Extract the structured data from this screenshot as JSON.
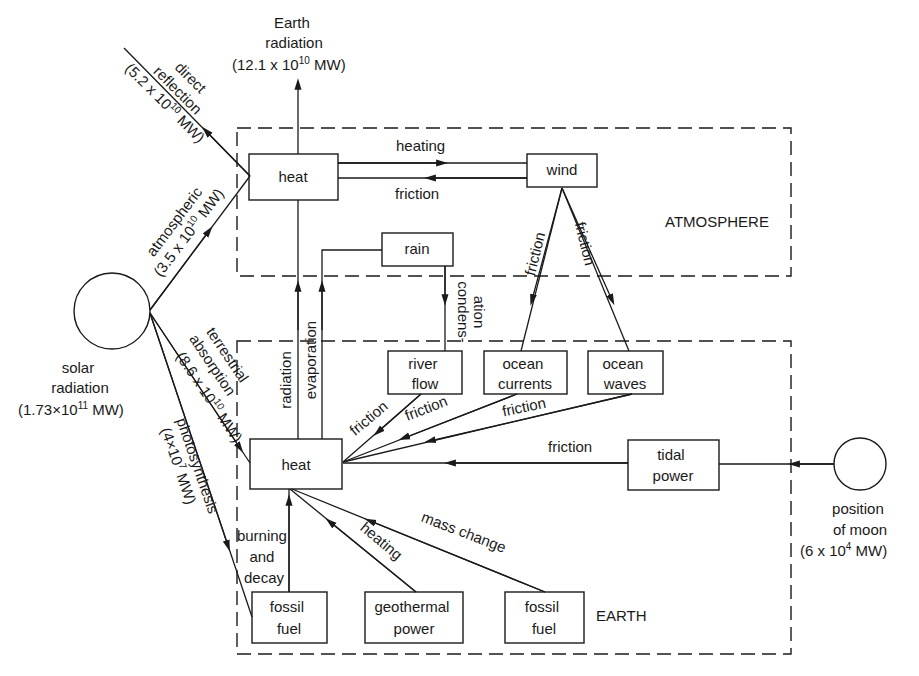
{
  "regions": {
    "atmosphere": "ATMOSPHERE",
    "earth": "EARTH"
  },
  "sources": {
    "sun": {
      "line1": "solar",
      "line2": "radiation",
      "value_base": "(1.73×10",
      "value_exp": "11",
      "value_unit": " MW)"
    },
    "moon": {
      "line1": "position",
      "line2": "of moon",
      "value_base": "(6 x 10",
      "value_exp": "4",
      "value_unit": " MW)"
    }
  },
  "outputs": {
    "earth_radiation": {
      "line1": "Earth",
      "line2": "radiation",
      "value_base": "(12.1 x 10",
      "value_exp": "10",
      "value_unit": " MW)"
    },
    "direct_reflection": {
      "line1": "direct",
      "line2": "reflection",
      "value_base": "(5.2 x 10",
      "value_exp": "10",
      "value_unit": " MW)"
    }
  },
  "boxes": {
    "atm_heat": "heat",
    "wind": "wind",
    "rain": "rain",
    "river_flow": [
      "river",
      "flow"
    ],
    "ocean_currents": [
      "ocean",
      "currents"
    ],
    "ocean_waves": [
      "ocean",
      "waves"
    ],
    "earth_heat": "heat",
    "tidal_power": [
      "tidal",
      "power"
    ],
    "fossil_fuel_left": [
      "fossil",
      "fuel"
    ],
    "geothermal_power": [
      "geothermal",
      "power"
    ],
    "fossil_fuel_right": [
      "fossil",
      "fuel"
    ]
  },
  "flows": {
    "atmospheric": {
      "line1": "atmospheric",
      "value_base": "(3.5 x 10",
      "value_exp": "10",
      "value_unit": " MW)"
    },
    "terrestrial": {
      "line1": "terrestrial",
      "line2": "absorption",
      "value_base": "(8.6 x 10",
      "value_exp": "10",
      "value_unit": " MW)"
    },
    "photosynthesis": {
      "line1": "photosynthesis",
      "value_base": "(4×10",
      "value_exp": "7",
      "value_unit": " MW)"
    },
    "heating_top": "heating",
    "friction_top": "friction",
    "friction_wind_left": "friction",
    "friction_wind_right": "friction",
    "condensation_1": "condens-",
    "condensation_2": "ation",
    "radiation": "radiation",
    "evaporation": "evaporation",
    "friction_river": "friction",
    "friction_currents": "friction",
    "friction_waves": "friction",
    "friction_tidal": "friction",
    "burning_1": "burning",
    "burning_2": "and",
    "burning_3": "decay",
    "heating_geo": "heating",
    "mass_change": "mass change"
  }
}
